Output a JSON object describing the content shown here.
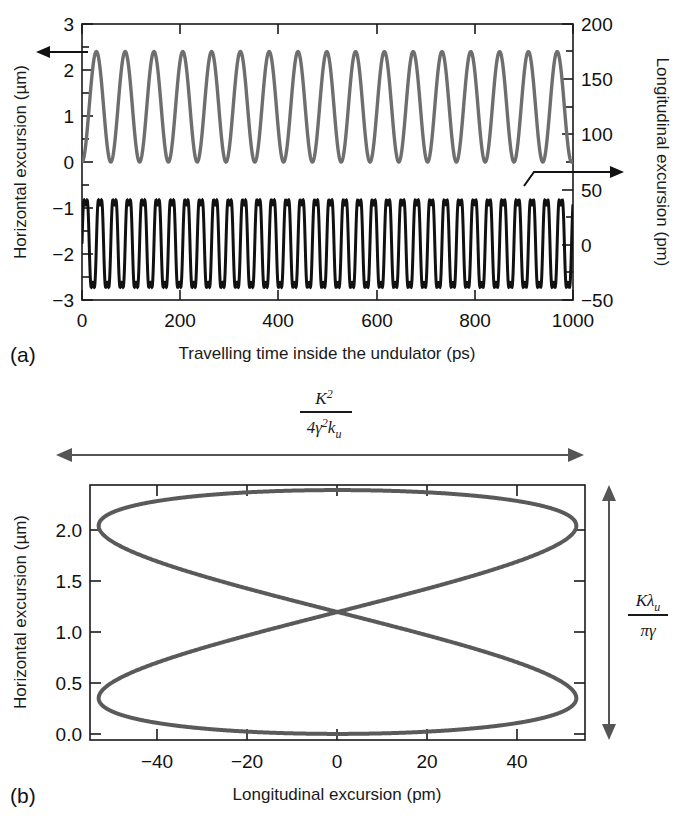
{
  "figure": {
    "background": "#ffffff",
    "panels": [
      {
        "tag": "(a)",
        "name": "panel-a-oscillations",
        "xlabel": "Travelling time inside the undulator (ps)",
        "ylabel_left": "Horizontal excursion (µm)",
        "ylabel_right": "Longitudinal excursion (pm)",
        "xticks": [
          "0",
          "200",
          "400",
          "600",
          "800",
          "1000"
        ],
        "yticks_left": [
          "3",
          "2",
          "1",
          "0",
          "−1",
          "−2",
          "−3"
        ],
        "yticks_right": [
          "200",
          "150",
          "100",
          "50",
          "0",
          "−50"
        ],
        "annotations": [
          {
            "name": "left-arrow-annotation",
            "direction": "left"
          },
          {
            "name": "right-arrow-annotation",
            "direction": "right"
          }
        ]
      },
      {
        "tag": "(b)",
        "name": "panel-b-figure-eight",
        "xlabel": "Longitudinal excursion (pm)",
        "ylabel": "Horizontal excursion (µm)",
        "xticks": [
          "−40",
          "−20",
          "0",
          "20",
          "40"
        ],
        "yticks": [
          "0.0",
          "0.5",
          "1.0",
          "1.5",
          "2.0"
        ],
        "top_formula": {
          "numerator": "K",
          "numerator_sup": "2",
          "denominator_pre": "4",
          "denominator_gamma": "γ",
          "denominator_gamma_sup": "2",
          "denominator_k": "k",
          "denominator_k_sub": "u"
        },
        "right_formula": {
          "numerator_k": "K",
          "numerator_lambda": "λ",
          "numerator_lambda_sub": "u",
          "denominator_pi": "π",
          "denominator_gamma": "γ"
        }
      }
    ],
    "colors": {
      "horizontal_curve": "#6e6e6e",
      "longitudinal_curve": "#111111",
      "figure_eight": "#5a5a5a",
      "axis": "#1a1a1a",
      "annotation_arrow": "#555555"
    }
  },
  "chart_data": [
    {
      "type": "line",
      "name": "panel-a",
      "title": "",
      "xlabel": "Travelling time inside the undulator (ps)",
      "ylabel": "Horizontal excursion (µm)",
      "ylabel2": "Longitudinal excursion (pm)",
      "xlim": [
        0,
        1040
      ],
      "ylim": [
        -3,
        3
      ],
      "ylim2": [
        -50,
        200
      ],
      "xticks": [
        0,
        200,
        400,
        600,
        800,
        1000
      ],
      "yticks": [
        -3,
        -2,
        -1,
        0,
        1,
        2,
        3
      ],
      "yticks2": [
        -50,
        0,
        50,
        100,
        150,
        200
      ],
      "grid": false,
      "legend": "none",
      "series": [
        {
          "name": "Horizontal excursion",
          "axis": "left",
          "color": "#6e6e6e",
          "waveform": "cosine-rectified",
          "amplitude": 1.2,
          "offset": 1.2,
          "min": 0.0,
          "max": 2.4,
          "cycles": 17,
          "period_ps": 61
        },
        {
          "name": "Longitudinal excursion",
          "axis": "right",
          "color": "#111111",
          "waveform": "sawtooth-oscillation",
          "min_pm": -50,
          "max_pm": 55,
          "cycles": 34,
          "period_ps": 30.5,
          "plotted_left_axis_min": -3.0,
          "plotted_left_axis_max": -0.55
        }
      ]
    },
    {
      "type": "line",
      "name": "panel-b",
      "title": "",
      "xlabel": "Longitudinal excursion (pm)",
      "ylabel": "Horizontal excursion (µm)",
      "xlim": [
        -57,
        57
      ],
      "ylim": [
        -0.06,
        2.45
      ],
      "xticks": [
        -40,
        -20,
        0,
        20,
        40
      ],
      "yticks": [
        0.0,
        0.5,
        1.0,
        1.5,
        2.0
      ],
      "grid": false,
      "legend": "none",
      "series": [
        {
          "name": "Figure-eight trajectory",
          "color": "#5a5a5a",
          "shape": "figure-eight",
          "x_half_width_pm": 55,
          "y_min_um": 0.0,
          "y_max_um": 2.4,
          "crossing_point": [
            0,
            1.18
          ],
          "left_lobe_tip": [
            -55,
            2.02
          ],
          "right_lobe_tip": [
            55,
            2.02
          ],
          "left_lower_tip": [
            -55,
            0.38
          ],
          "right_lower_tip": [
            55,
            0.38
          ]
        }
      ],
      "span_annotations": [
        {
          "name": "horizontal-span",
          "orientation": "horizontal",
          "label": "K² / 4γ²k_u"
        },
        {
          "name": "vertical-span",
          "orientation": "vertical",
          "label": "Kλ_u / πγ"
        }
      ]
    }
  ]
}
